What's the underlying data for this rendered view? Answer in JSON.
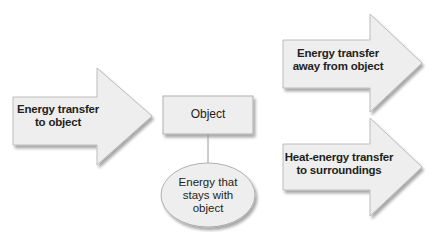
{
  "diagram": {
    "type": "energy-flow",
    "colors": {
      "shape_fill": "#eeeeee",
      "shape_stroke": "#a8a8a8",
      "shadow": "#cfcfcf",
      "text": "#231f20",
      "connector": "#9a9a9a"
    },
    "input_arrow": {
      "line1": "Energy transfer",
      "line2": "to object"
    },
    "object_box": {
      "label": "Object"
    },
    "retained_ellipse": {
      "line1": "Energy that",
      "line2": "stays with",
      "line3": "object"
    },
    "output_arrows": [
      {
        "line1": "Energy transfer",
        "line2": "away from object"
      },
      {
        "line1": "Heat-energy transfer",
        "line2": "to surroundings"
      }
    ]
  }
}
